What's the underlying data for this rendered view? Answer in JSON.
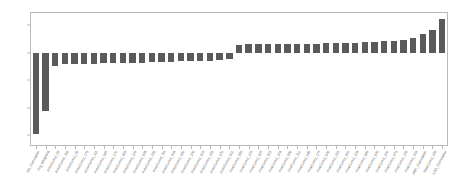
{
  "chart_data": {
    "type": "bar",
    "title": "",
    "subtitle": "",
    "xlabel": "",
    "ylabel": "",
    "ylim": [
      -3.35,
      1.45
    ],
    "yticks": [
      1,
      0,
      -1,
      -2,
      -3
    ],
    "ytick_labels": [
      "1",
      "0",
      "-1",
      "-2",
      "-3"
    ],
    "grid": false,
    "legend": null,
    "bar_color": "#5a5a5a",
    "frame_color": "#b9b9b9",
    "orientation": "vertical",
    "sorted": "ascending",
    "categories": [
      "Mo_Cumulative",
      "Arg_Weighted",
      "AmeCumul_03",
      "AmeCumul_118",
      "AmeCumul_05",
      "AmeCumul_173",
      "AmeCumul_111",
      "AmeCumul_047",
      "AmeCumul_172",
      "AmeCumul_081",
      "AmeCumul_129",
      "AmeCumul_034",
      "AmeCumul_155",
      "AmeCumul_Tot",
      "AmeCumul_064",
      "AmeCumul_092",
      "AmeCumul_108",
      "AmeCumul_023",
      "AmeCumul_141",
      "AmeCumul_076",
      "AmeCumul_012",
      "PosCumul_059",
      "PosCumul_133",
      "PosCumul_087",
      "PosCumul_021",
      "PosCumul_164",
      "PosCumul_098",
      "PosCumul_112",
      "PosCumul_045",
      "PosCumul_177",
      "PosCumul_030",
      "PosCumul_151",
      "PosCumul_066",
      "PosCumul_124",
      "PosCumul_089",
      "PosCumul_038",
      "PosCumul_160",
      "PosCumul_073",
      "PosCumul_105",
      "PosCumul_019",
      "ARP_Cumulative",
      "MaxCumul_143",
      "LOA_Cumulative"
    ],
    "values": [
      -2.95,
      -2.1,
      -0.47,
      -0.42,
      -0.41,
      -0.4,
      -0.39,
      -0.38,
      -0.38,
      -0.37,
      -0.36,
      -0.35,
      -0.34,
      -0.33,
      -0.32,
      -0.31,
      -0.3,
      -0.29,
      -0.28,
      -0.26,
      -0.24,
      0.3,
      0.31,
      0.31,
      0.32,
      0.32,
      0.33,
      0.33,
      0.34,
      0.34,
      0.35,
      0.35,
      0.36,
      0.37,
      0.38,
      0.4,
      0.42,
      0.45,
      0.48,
      0.55,
      0.67,
      0.82,
      1.22
    ]
  }
}
